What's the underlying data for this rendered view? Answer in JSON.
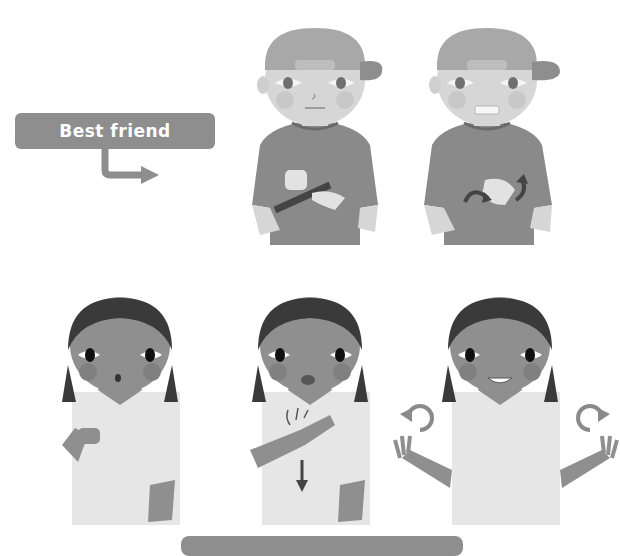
{
  "sign": {
    "title": "Best friend",
    "description": "Sign language illustration sequence"
  },
  "figures": {
    "boy": {
      "count": 2,
      "steps": [
        "link-index-fingers",
        "twist-hands"
      ]
    },
    "girl": {
      "count": 3,
      "steps": [
        "closed-fist",
        "hand-on-chest-down",
        "open-hands-rotate"
      ]
    }
  },
  "colors": {
    "label_bg": "#8e8e8e",
    "shirt_boy": "#8a8a8a",
    "skin_boy": "#d6d6d6",
    "cap": "#a8a8a8",
    "skin_girl": "#8f8f8f",
    "hair_girl": "#3a3a3a",
    "blouse": "#e6e6e6",
    "arrow": "#555555"
  }
}
